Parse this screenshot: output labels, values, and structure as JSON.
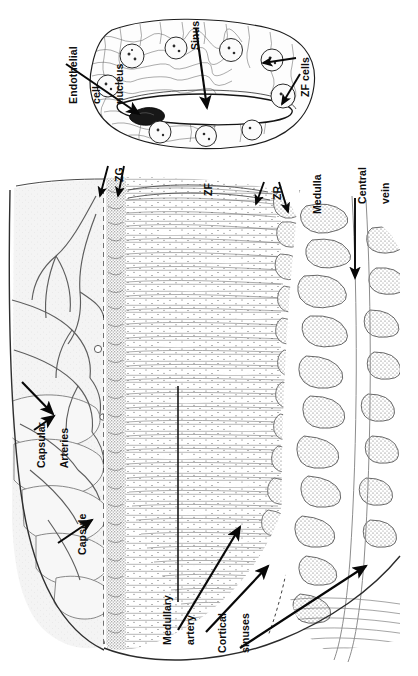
{
  "figure": {
    "orientation": "labels rotated 90 degrees counter-clockwise",
    "background_color": "#ffffff",
    "ink_color": "#111111"
  },
  "inset": {
    "name": "sinus-detail-inset",
    "description": "High magnification detail of an adrenal cortical sinus surrounded by zona fasciculata cells",
    "labels": [
      {
        "id": "endothelial-cell-nucleus",
        "text": "Endothelial\ncell\nnucleus",
        "lines": [
          "Endothelial",
          "cell",
          "nucleus"
        ],
        "arrows": 1
      },
      {
        "id": "sinus",
        "text": "Sinus",
        "lines": [
          "Sinus"
        ],
        "arrows": 1
      },
      {
        "id": "zf-cells",
        "text": "ZF cells",
        "lines": [
          "ZF cells"
        ],
        "arrows": 2
      }
    ]
  },
  "main": {
    "name": "adrenal-section-diagram",
    "description": "Low magnification drawing of adrenal gland from capsule through zona glomerulosa, fasciculata, reticularis, medulla and central vein",
    "labels": [
      {
        "id": "zg",
        "text": "ZG",
        "lines": [
          "ZG"
        ],
        "arrows": 2,
        "meaning": "zona glomerulosa"
      },
      {
        "id": "zf",
        "text": "ZF",
        "lines": [
          "ZF"
        ],
        "arrows": 0,
        "meaning": "zona fasciculata"
      },
      {
        "id": "zr",
        "text": "ZR",
        "lines": [
          "ZR"
        ],
        "arrows": 2,
        "meaning": "zona reticularis"
      },
      {
        "id": "medulla",
        "text": "Medulla",
        "lines": [
          "Medulla"
        ],
        "arrows": 0
      },
      {
        "id": "central-vein",
        "text": "Central\nvein",
        "lines": [
          "Central",
          "vein"
        ],
        "arrows": 1
      },
      {
        "id": "capsular-arteries",
        "text": "Capsular\nArteries",
        "lines": [
          "Capsular",
          "Arteries"
        ],
        "arrows": 2
      },
      {
        "id": "capsule",
        "text": "Capsule",
        "lines": [
          "Capsule"
        ],
        "arrows": 1
      },
      {
        "id": "medullary-artery",
        "text": "Medullary\nartery",
        "lines": [
          "Medullary",
          "artery"
        ],
        "arrows": 1
      },
      {
        "id": "cortical-sinuses",
        "text": "Cortical\nsinuses",
        "lines": [
          "Cortical",
          "sinuses"
        ],
        "arrows": 2
      }
    ]
  },
  "edge_caption": {
    "text": "",
    "visible": false
  }
}
